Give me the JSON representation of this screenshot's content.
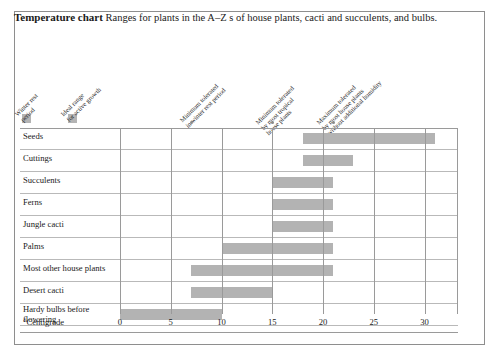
{
  "title": {
    "strong": "Temperature chart",
    "rest": " Ranges for plants in the A–Z s of house plants, cacti and succulents, and bulbs."
  },
  "legend": [
    {
      "name": "winter-rest-period",
      "label": "Winter rest\nperiod",
      "color": "#b4b4b4"
    },
    {
      "name": "ideal-range-active-growth",
      "label": "Ideal range\nfor active growth",
      "color": "#b4b4b4"
    }
  ],
  "column_headers": [
    {
      "name": "min-tolerated-winter-rest",
      "label": "Minimum tolerated\nin winter rest period",
      "value": 7
    },
    {
      "name": "min-tolerated-tropical",
      "label": "Minimum tolerated\nby most tropical\nhouse plants",
      "value": 15
    },
    {
      "name": "max-tolerated-no-humidity",
      "label": "Maximum tolerated\nby most house plants\nwithout additional humidity",
      "value": 21
    }
  ],
  "axis": {
    "unit_label": "°Centigrade",
    "ticks": [
      0,
      5,
      10,
      15,
      20,
      25,
      30
    ],
    "min": 0,
    "max": 33.5
  },
  "chart_data": {
    "type": "bar",
    "title": "Temperature chart",
    "subtitle": "Ranges for plants in the A–Z s of house plants, cacti and succulents, and bulbs.",
    "xlabel": "°Centigrade",
    "ylabel": "",
    "xlim": [
      0,
      33.5
    ],
    "xticks": [
      0,
      5,
      10,
      15,
      20,
      25,
      30
    ],
    "grid": true,
    "orientation": "horizontal",
    "bar_color": "#b3b3b3",
    "categories": [
      "Seeds",
      "Cuttings",
      "Succulents",
      "Ferns",
      "Jungle cacti",
      "Palms",
      "Most other house plants",
      "Desert cacti",
      "Hardy bulbs before flowering"
    ],
    "ranges": [
      {
        "category": "Seeds",
        "start": 18,
        "end": 31
      },
      {
        "category": "Cuttings",
        "start": 18,
        "end": 23
      },
      {
        "category": "Succulents",
        "start": 15,
        "end": 21
      },
      {
        "category": "Ferns",
        "start": 15,
        "end": 21
      },
      {
        "category": "Jungle cacti",
        "start": 15,
        "end": 21
      },
      {
        "category": "Palms",
        "start": 10,
        "end": 21
      },
      {
        "category": "Most other house plants",
        "start": 7,
        "end": 21
      },
      {
        "category": "Desert cacti",
        "start": 7,
        "end": 15
      },
      {
        "category": "Hardy bulbs before flowering",
        "start": 0,
        "end": 10
      }
    ],
    "markers": [
      {
        "label": "Minimum tolerated in winter rest period",
        "value": 7
      },
      {
        "label": "Minimum tolerated by most tropical house plants",
        "value": 15
      },
      {
        "label": "Maximum tolerated by most house plants without additional humidity",
        "value": 21
      }
    ],
    "legend": [
      "Winter rest period",
      "Ideal range for active growth"
    ],
    "legend_position": "top-left"
  },
  "rows": [
    {
      "label": "Seeds",
      "name": "table-row-seeds",
      "two_line": false
    },
    {
      "label": "Cuttings",
      "name": "table-row-cuttings",
      "two_line": false
    },
    {
      "label": "Succulents",
      "name": "table-row-succulents",
      "two_line": false
    },
    {
      "label": "Ferns",
      "name": "table-row-ferns",
      "two_line": false
    },
    {
      "label": "Jungle cacti",
      "name": "table-row-jungle-cacti",
      "two_line": false
    },
    {
      "label": "Palms",
      "name": "table-row-palms",
      "two_line": false
    },
    {
      "label": "Most other house plants",
      "name": "table-row-most-other-house-plants",
      "two_line": false
    },
    {
      "label": "Desert cacti",
      "name": "table-row-desert-cacti",
      "two_line": false
    },
    {
      "label": "Hardy bulbs before\nflowering",
      "name": "table-row-hardy-bulbs",
      "two_line": true
    }
  ]
}
